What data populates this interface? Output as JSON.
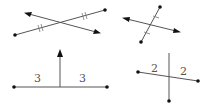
{
  "colors": {
    "line": "#555555",
    "point": "#111111",
    "label": "#555555",
    "background": "#ffffff"
  },
  "figures": [
    {
      "id": "fig1",
      "description": "Line bisects segment (not perpendicular)",
      "segment": {
        "p1": [
          15,
          35
        ],
        "p2": [
          105,
          10
        ]
      },
      "line": {
        "from": [
          25,
          13
        ],
        "to": [
          100,
          33
        ],
        "arrows": "both"
      },
      "tick_marks": "double",
      "labels": []
    },
    {
      "id": "fig2",
      "description": "Line bisects segment (perpendicular-like)",
      "segment": {
        "p1": [
          160,
          7
        ],
        "p2": [
          141,
          42
        ]
      },
      "line": {
        "from": [
          123,
          18
        ],
        "to": [
          180,
          32
        ],
        "arrows": "both"
      },
      "tick_marks": "single",
      "labels": []
    },
    {
      "id": "fig3",
      "description": "Perpendicular ray from midpoint of segment",
      "segment": {
        "p1": [
          14,
          87
        ],
        "p2": [
          107,
          87
        ]
      },
      "ray": {
        "from": [
          60,
          87
        ],
        "to": [
          60,
          50
        ],
        "arrows": "end"
      },
      "labels": [
        "3",
        "3"
      ]
    },
    {
      "id": "fig4",
      "description": "Perpendicular segment through midpoint",
      "segment": {
        "p1": [
          138,
          72
        ],
        "p2": [
          198,
          81
        ]
      },
      "cross_segment": {
        "from": [
          169,
          53
        ],
        "to": [
          169,
          101
        ]
      },
      "labels": [
        "2",
        "2"
      ]
    }
  ]
}
